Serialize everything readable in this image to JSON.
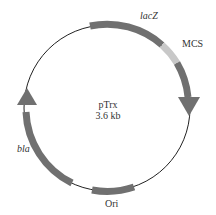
{
  "plasmid": {
    "name": "pTrx",
    "size": "3.6 kb"
  },
  "features": {
    "lacZ": {
      "label": "lacZ"
    },
    "mcs": {
      "label": "MCS"
    },
    "bla": {
      "label": "bla"
    },
    "ori": {
      "label": "Ori"
    }
  },
  "colors": {
    "backbone": "#222222",
    "feature": "#707070",
    "mcs": "#c8c8c8"
  }
}
